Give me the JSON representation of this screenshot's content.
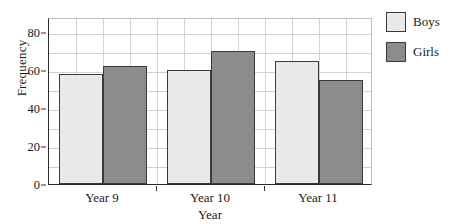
{
  "chart_data": {
    "type": "bar",
    "title": "",
    "subtitle": "",
    "xlabel": "Year",
    "ylabel": "Frequency",
    "categories": [
      "Year 9",
      "Year 10",
      "Year 11"
    ],
    "series": [
      {
        "name": "Boys",
        "color": "#e9e9e9",
        "values": [
          58,
          60,
          65
        ]
      },
      {
        "name": "Girls",
        "color": "#8c8c8c",
        "values": [
          62,
          70,
          55
        ]
      }
    ],
    "ylim": [
      0,
      88
    ],
    "yticks": [
      0,
      20,
      40,
      60,
      80
    ],
    "ytick_labels": [
      "0",
      "20",
      "40",
      "60",
      "80"
    ],
    "y_minor_step": 10,
    "grid": true,
    "grid_color": "#d3d3d3",
    "legend_position": "right",
    "legend_entries": [
      "Boys",
      "Girls"
    ],
    "axis_color": "#2b2b2b",
    "bar_outline_color": "#3a3a3a",
    "background": "#ffffff"
  }
}
